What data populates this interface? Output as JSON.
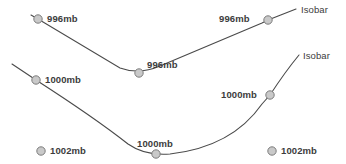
{
  "diagram": {
    "background_color": "#ffffff",
    "line_color": "#4a4a4a",
    "marker_fill": "#c9c9c9",
    "marker_stroke": "#7d7d7d",
    "text_color": "#3c3c3c"
  },
  "labels": [
    {
      "id": "pressure-996-left",
      "text": "996mb",
      "x": 47,
      "y": 14
    },
    {
      "id": "pressure-996-middle",
      "text": "996mb",
      "x": 147,
      "y": 60
    },
    {
      "id": "pressure-996-right",
      "text": "996mb",
      "x": 219,
      "y": 14
    },
    {
      "id": "isobar-top",
      "text": "Isobar",
      "x": 301,
      "y": 5
    },
    {
      "id": "isobar-bottom",
      "text": "Isobar",
      "x": 303,
      "y": 51
    },
    {
      "id": "pressure-1000-left",
      "text": "1000mb",
      "x": 45,
      "y": 75
    },
    {
      "id": "pressure-1000-middle",
      "text": "1000mb",
      "x": 137,
      "y": 139
    },
    {
      "id": "pressure-1000-right",
      "text": "1000mb",
      "x": 221,
      "y": 90
    },
    {
      "id": "pressure-1002-left",
      "text": "1002mb",
      "x": 50,
      "y": 146
    },
    {
      "id": "pressure-1002-right",
      "text": "1002mb",
      "x": 281,
      "y": 146
    }
  ],
  "markers": [
    {
      "id": "marker-996-left",
      "cx": 38,
      "cy": 19,
      "r": 4.2,
      "label": "996mb"
    },
    {
      "id": "marker-996-middle",
      "cx": 139,
      "cy": 73,
      "r": 4.2,
      "label": "996mb"
    },
    {
      "id": "marker-996-right",
      "cx": 268,
      "cy": 20,
      "r": 4.2,
      "label": "996mb"
    },
    {
      "id": "marker-1000-left",
      "cx": 36,
      "cy": 80,
      "r": 4.2,
      "label": "1000mb"
    },
    {
      "id": "marker-1000-middle",
      "cx": 156,
      "cy": 154,
      "r": 4.2,
      "label": "1000mb"
    },
    {
      "id": "marker-1000-right",
      "cx": 270,
      "cy": 95,
      "r": 4.2,
      "label": "1000mb"
    },
    {
      "id": "marker-1002-left",
      "cx": 41,
      "cy": 151,
      "r": 4.2,
      "label": "1002mb"
    },
    {
      "id": "marker-1002-right",
      "cx": 272,
      "cy": 151,
      "r": 4.2,
      "label": "1002mb"
    }
  ],
  "curves": [
    {
      "id": "isobar-line-996",
      "pressure": "996mb",
      "path": "M 31 15 L 38 19 L 120 68 Q 139 75 160 66 Q 215 43 262 23 L 268 20 L 296 9"
    },
    {
      "id": "isobar-line-1000",
      "pressure": "1000mb",
      "path": "M 12 64 L 36 80 Q 95 118 128 144 Q 145 156 170 154 Q 232 147 262 104 L 270 95 Q 285 72 299 55"
    }
  ]
}
